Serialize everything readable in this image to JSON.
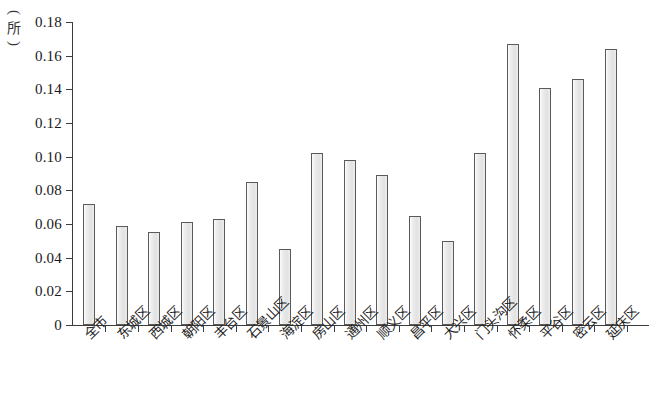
{
  "chart_data": {
    "type": "bar",
    "title": "",
    "xlabel": "",
    "ylabel": "(所)",
    "y_unit": "所",
    "ylim": [
      0,
      0.18
    ],
    "ytick_step": 0.02,
    "grid": false,
    "legend": null,
    "bar_fill_color": "#e9e9e9",
    "bar_border_color": "#5a5a5a",
    "axis_color": "#3c3c3c",
    "ytick_labels": [
      "0.18",
      "0.16",
      "0.14",
      "0.12",
      "0.10",
      "0.08",
      "0.06",
      "0.04",
      "0.02",
      "0"
    ],
    "ytick_values": [
      0.18,
      0.16,
      0.14,
      0.12,
      0.1,
      0.08,
      0.06,
      0.04,
      0.02,
      0
    ],
    "categories": [
      "全市",
      "东城区",
      "西城区",
      "朝阳区",
      "丰台区",
      "石景山区",
      "海淀区",
      "房山区",
      "通州区",
      "顺义区",
      "昌平区",
      "大兴区",
      "门头沟区",
      "怀柔区",
      "平谷区",
      "密云区",
      "延庆区"
    ],
    "values": [
      0.072,
      0.059,
      0.055,
      0.061,
      0.063,
      0.085,
      0.045,
      0.102,
      0.098,
      0.089,
      0.065,
      0.05,
      0.102,
      0.167,
      0.141,
      0.146,
      0.164
    ]
  }
}
